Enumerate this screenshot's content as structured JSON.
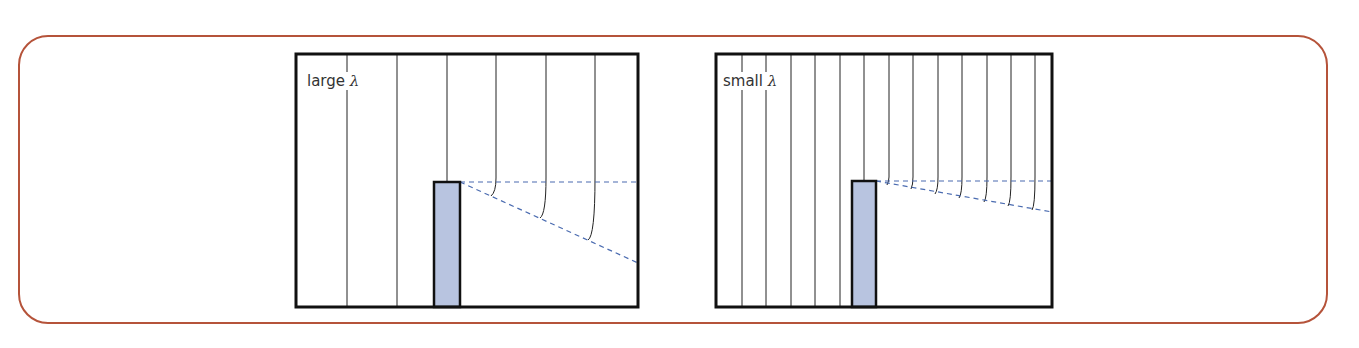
{
  "figure": {
    "border_color": "#b5533a",
    "barrier_fill": "#b8c4e0",
    "dash_color": "#4a6bb0",
    "panels": [
      {
        "id": "large-lambda",
        "label_text": "large ",
        "label_symbol": "λ",
        "box": {
          "x": 296,
          "y": 54,
          "w": 342,
          "h": 253
        },
        "barrier": {
          "x": 434,
          "y": 182,
          "w": 26,
          "h": 125
        },
        "wavefront_x": [
          347,
          397,
          447,
          496,
          546,
          595
        ],
        "diffracted": [
          {
            "x": 496,
            "end_x": 491,
            "end_y": 196
          },
          {
            "x": 546,
            "end_x": 540,
            "end_y": 218
          },
          {
            "x": 595,
            "end_x": 588,
            "end_y": 240
          }
        ],
        "shadow_dash_end_y": 263
      },
      {
        "id": "small-lambda",
        "label_text": "small ",
        "label_symbol": "λ",
        "box": {
          "x": 716,
          "y": 54,
          "w": 336,
          "h": 253
        },
        "barrier": {
          "x": 852,
          "y": 181,
          "w": 24,
          "h": 126
        },
        "wavefront_x": [
          742,
          766,
          791,
          815,
          840,
          864,
          889,
          913,
          938,
          962,
          987,
          1011,
          1035
        ],
        "diffracted": [
          {
            "x": 889,
            "end_x": 887,
            "end_y": 185
          },
          {
            "x": 913,
            "end_x": 911,
            "end_y": 189
          },
          {
            "x": 938,
            "end_x": 935,
            "end_y": 194
          },
          {
            "x": 962,
            "end_x": 959,
            "end_y": 198
          },
          {
            "x": 987,
            "end_x": 984,
            "end_y": 202
          },
          {
            "x": 1011,
            "end_x": 1008,
            "end_y": 206
          },
          {
            "x": 1035,
            "end_x": 1032,
            "end_y": 210
          }
        ],
        "shadow_dash_end_y": 212
      }
    ]
  }
}
